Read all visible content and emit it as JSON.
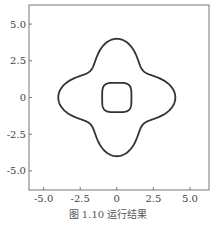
{
  "chart_data": {
    "type": "line",
    "title": "",
    "xlabel": "",
    "ylabel": "",
    "xlim": [
      -6.0,
      6.3
    ],
    "ylim": [
      -6.3,
      6.3
    ],
    "grid": false,
    "x_ticks": [
      "-5.0",
      "-2.5",
      "0",
      "2.5",
      "5.0"
    ],
    "y_ticks": [
      "5.0",
      "2.5",
      "0",
      "-2.5",
      "-5.0"
    ],
    "series": [
      {
        "name": "outer-curve",
        "description": "four-lobed closed contour, extent approx ±4 on each axis",
        "extent": 4.0
      },
      {
        "name": "inner-curve",
        "description": "rounded square contour, extent approx ±1 on each axis",
        "extent": 1.0
      }
    ]
  },
  "caption": "图 1.10  运行结果"
}
